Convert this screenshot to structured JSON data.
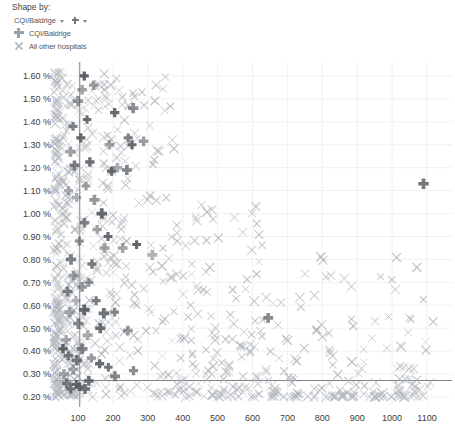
{
  "controls": {
    "shape_by_title": "Shape by:",
    "shape_by_value": "CQI/Baldrige",
    "caret_icon": "chevron-down-icon",
    "marker_icon": "plus-marker-icon"
  },
  "legend": {
    "items": [
      {
        "label": "CQI/Baldrige",
        "symbol": "plus",
        "color": "#9aa0a6"
      },
      {
        "label": "All other hospitals",
        "symbol": "x",
        "color": "#b9bec4"
      }
    ]
  },
  "colors": {
    "cqi_marker": "#555a60",
    "other_marker": "#b0b5bb",
    "reference_line": "#6f7479",
    "gridline": "#f0f1f3",
    "axis_text": "#3c3c3c"
  },
  "chart_data": {
    "type": "scatter",
    "title": "",
    "xlabel": "",
    "ylabel": "",
    "xlim": [
      0,
      1140
    ],
    "ylim": [
      0.18,
      1.66
    ],
    "grid": true,
    "legend_position": "top-left",
    "x_ticks": [
      100,
      200,
      300,
      400,
      500,
      600,
      700,
      800,
      900,
      1000,
      1100
    ],
    "x_tick_labels": [
      "100",
      "200",
      "300",
      "400",
      "500",
      "600",
      "700",
      "800",
      "900",
      "1000",
      "1100"
    ],
    "y_ticks": [
      0.2,
      0.3,
      0.4,
      0.5,
      0.6,
      0.7,
      0.8,
      0.9,
      1.0,
      1.1,
      1.2,
      1.3,
      1.4,
      1.5,
      1.6
    ],
    "y_tick_labels": [
      "0.20 %",
      "0.30 %",
      "0.40 %",
      "0.50 %",
      "0.60 %",
      "0.70 %",
      "0.80 %",
      "0.90 %",
      "1.00 %",
      "1.10 %",
      "1.20 %",
      "1.30 %",
      "1.40 %",
      "1.50 %",
      "1.60 %"
    ],
    "reference_lines": [
      {
        "orientation": "vertical",
        "x": 105
      },
      {
        "orientation": "horizontal",
        "y": 0.272
      }
    ],
    "series": [
      {
        "name": "CQI/Baldrige",
        "marker": "plus",
        "color": "#555a60",
        "points": [
          [
            1090,
            1.13
          ],
          [
            258,
            1.46
          ],
          [
            255,
            1.3
          ],
          [
            244,
            1.33
          ],
          [
            288,
            1.315
          ],
          [
            205,
            1.44
          ],
          [
            190,
            1.3
          ],
          [
            196,
            1.185
          ],
          [
            213,
            1.2
          ],
          [
            240,
            1.19
          ],
          [
            145,
            1.56
          ],
          [
            118,
            1.6
          ],
          [
            126,
            1.41
          ],
          [
            112,
            1.54
          ],
          [
            100,
            1.49
          ],
          [
            134,
            1.225
          ],
          [
            108,
            1.33
          ],
          [
            147,
            1.06
          ],
          [
            168,
            1.0
          ],
          [
            155,
            0.93
          ],
          [
            186,
            0.9
          ],
          [
            176,
            0.85
          ],
          [
            228,
            0.85
          ],
          [
            313,
            0.82
          ],
          [
            268,
            0.865
          ],
          [
            123,
            1.12
          ],
          [
            119,
            0.96
          ],
          [
            104,
            0.88
          ],
          [
            96,
            1.07
          ],
          [
            90,
            1.21
          ],
          [
            86,
            1.38
          ],
          [
            78,
            1.27
          ],
          [
            73,
            1.1
          ],
          [
            140,
            0.78
          ],
          [
            131,
            0.7
          ],
          [
            112,
            0.68
          ],
          [
            152,
            0.62
          ],
          [
            118,
            0.58
          ],
          [
            174,
            0.565
          ],
          [
            205,
            0.57
          ],
          [
            243,
            0.49
          ],
          [
            164,
            0.5
          ],
          [
            128,
            0.47
          ],
          [
            101,
            0.52
          ],
          [
            94,
            0.62
          ],
          [
            88,
            0.73
          ],
          [
            80,
            0.8
          ],
          [
            76,
            0.57
          ],
          [
            70,
            0.66
          ],
          [
            112,
            0.41
          ],
          [
            138,
            0.37
          ],
          [
            162,
            0.345
          ],
          [
            187,
            0.33
          ],
          [
            97,
            0.36
          ],
          [
            86,
            0.32
          ],
          [
            72,
            0.38
          ],
          [
            66,
            0.45
          ],
          [
            259,
            0.315
          ],
          [
            206,
            0.29
          ],
          [
            131,
            0.27
          ],
          [
            95,
            0.255
          ],
          [
            79,
            0.235
          ],
          [
            68,
            0.26
          ],
          [
            60,
            0.3
          ],
          [
            57,
            0.41
          ],
          [
            645,
            0.545
          ],
          [
            104,
            0.245
          ],
          [
            120,
            0.235
          ]
        ]
      },
      {
        "name": "All other hospitals",
        "marker": "x",
        "color": "#b0b5bb",
        "note": "Large dense cluster concentrated at low x values with a long right tail; ~900 points approximated.",
        "count_approx": 900
      }
    ]
  }
}
